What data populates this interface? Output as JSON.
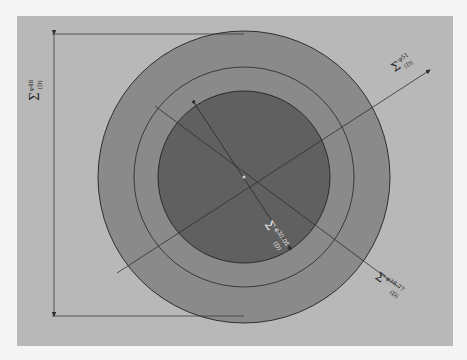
{
  "diagram": {
    "type": "concentric-circle-dimension-drawing",
    "panel": {
      "x": 17,
      "y": 16,
      "width": 436,
      "height": 330,
      "color": "#b8b8b8"
    },
    "center": {
      "x": 244,
      "y": 177
    },
    "rings": [
      {
        "name": "outer-ring",
        "r": 146,
        "fill": "#8a8a8a"
      },
      {
        "name": "middle-ring-dashed",
        "r": 110,
        "fill": "none"
      },
      {
        "name": "inner-circle",
        "r": 86,
        "fill": "#606060"
      }
    ],
    "line_color": "#2e2e2e",
    "labels": {
      "vertical_diameter": {
        "symbol": "Σ",
        "sup": "φ48",
        "sub": "(D)"
      },
      "upper_right_diameter": {
        "symbol": "Σ",
        "sup": "φ51",
        "sub": "(D)"
      },
      "inner_diameter": {
        "symbol": "Σ",
        "sup": "φ30.04",
        "sub": "(D)"
      },
      "lower_right_diameter": {
        "symbol": "Σ",
        "sup": "φ38.77",
        "sub": "(D)"
      }
    }
  }
}
